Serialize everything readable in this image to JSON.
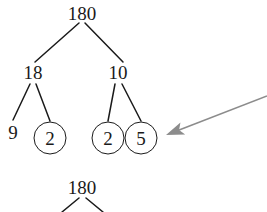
{
  "figure": {
    "type": "factor-tree-diagram",
    "background_color": "#ffffff",
    "ink_color": "#1a1a1a",
    "annotation_color": "#8c8c8c"
  },
  "tree_main": {
    "root": {
      "label": "180",
      "x": 82,
      "y": 13
    },
    "level2": [
      {
        "label": "18",
        "x": 33,
        "y": 72
      },
      {
        "label": "10",
        "x": 118,
        "y": 72
      }
    ],
    "leaves": [
      {
        "label": "9",
        "x": 13,
        "y": 132,
        "circled": false
      },
      {
        "label": "2",
        "x": 50,
        "y": 138,
        "circled": true
      },
      {
        "label": "2",
        "x": 108,
        "y": 138,
        "circled": true
      },
      {
        "label": "5",
        "x": 141,
        "y": 138,
        "circled": true
      }
    ],
    "edges": [
      {
        "from": "180",
        "to": "18",
        "x1": 79,
        "y1": 23,
        "x2": 35,
        "y2": 62
      },
      {
        "from": "180",
        "to": "10",
        "x1": 85,
        "y1": 23,
        "x2": 123,
        "y2": 62
      },
      {
        "from": "18",
        "to": "9",
        "x1": 30,
        "y1": 84,
        "x2": 13,
        "y2": 120
      },
      {
        "from": "18",
        "to": "2",
        "x1": 36,
        "y1": 84,
        "x2": 50,
        "y2": 121
      },
      {
        "from": "10",
        "to": "2",
        "x1": 115,
        "y1": 84,
        "x2": 108,
        "y2": 121
      },
      {
        "from": "10",
        "to": "5",
        "x1": 122,
        "y1": 84,
        "x2": 141,
        "y2": 121
      }
    ]
  },
  "tree_partial": {
    "root": {
      "label": "180",
      "x": 82,
      "y": 187
    },
    "edges": [
      {
        "x1": 79,
        "y1": 198,
        "x2": 62,
        "y2": 212
      },
      {
        "x1": 86,
        "y1": 198,
        "x2": 103,
        "y2": 212
      }
    ]
  },
  "annotation_arrow": {
    "name": "callout-arrow",
    "color": "#8c8c8c",
    "tail_x": 267,
    "tail_y": 96,
    "tip_x": 166,
    "tip_y": 135,
    "points_to": "circled prime leaves"
  }
}
